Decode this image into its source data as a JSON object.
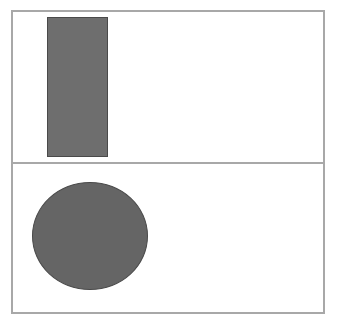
{
  "canvas": {
    "background": "#ffffff",
    "border_color": "#a8a8a8"
  },
  "panels": [
    {
      "id": "top",
      "shape": {
        "type": "rectangle",
        "fill": "#6e6e6e",
        "stroke": "#4a4a4a",
        "x": 47,
        "y": 17,
        "width": 61,
        "height": 140
      }
    },
    {
      "id": "bottom",
      "shape": {
        "type": "ellipse",
        "fill": "#656565",
        "stroke": "#4a4a4a",
        "cx": 90,
        "cy": 236,
        "rx": 58,
        "ry": 54
      }
    }
  ]
}
